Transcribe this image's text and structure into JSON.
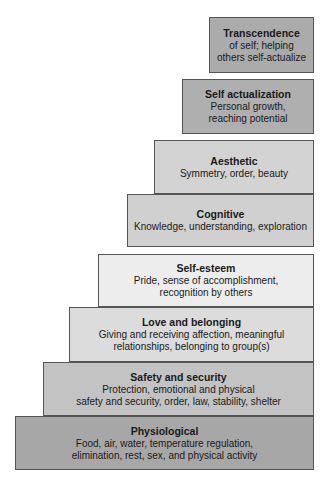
{
  "diagram": {
    "type": "hierarchy-staircase",
    "levels": [
      {
        "title": "Transcendence",
        "lines": [
          "of self; helping",
          "others self-actualize"
        ],
        "color": "#ababab"
      },
      {
        "title": "Self actualization",
        "lines": [
          "Personal growth,",
          "reaching potential"
        ],
        "color": "#afafaf"
      },
      {
        "title": "Aesthetic",
        "lines": [
          "Symmetry, order, beauty"
        ],
        "color": "#d3d3d3"
      },
      {
        "title": "Cognitive",
        "lines": [
          "Knowledge, understanding, exploration"
        ],
        "color": "#d0d0d0"
      },
      {
        "title": "Self-esteem",
        "lines": [
          "Pride, sense of accomplishment,",
          "recognition by others"
        ],
        "color": "#ededed"
      },
      {
        "title": "Love and belonging",
        "lines": [
          "Giving and receiving affection, meaningful",
          "relationships, belonging to group(s)"
        ],
        "color": "#dcdcdc"
      },
      {
        "title": "Safety and security",
        "lines": [
          "Protection, emotional and physical",
          "safety and security, order, law, stability, shelter"
        ],
        "color": "#c3c3c3"
      },
      {
        "title": "Physiological",
        "lines": [
          "Food, air, water, temperature regulation,",
          "elimination, rest, sex, and physical activity"
        ],
        "color": "#a7a7a7"
      }
    ]
  }
}
